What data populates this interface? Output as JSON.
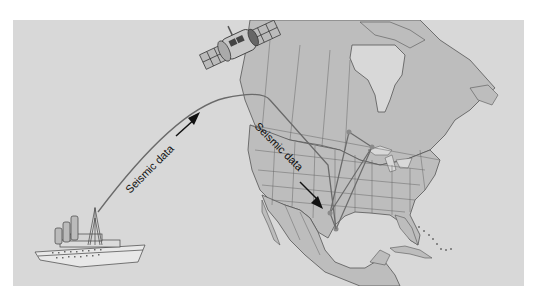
{
  "diagram": {
    "type": "data-transmission-map",
    "background_color": "#d8d8d8",
    "land_color": "#bdbdbd",
    "light_land_color": "#cfcfcf",
    "border_color": "#555555",
    "arrow_color": "#111111",
    "line_color": "#6a6a6a",
    "station_color": "#8a8a8a",
    "labels": {
      "ship_to_satellite": "Seismic data",
      "satellite_to_ground": "Seismic data"
    },
    "elements": [
      {
        "id": "ship",
        "icon": "ship-icon"
      },
      {
        "id": "satellite",
        "icon": "satellite-icon"
      },
      {
        "id": "map",
        "icon": "north-america-map"
      },
      {
        "id": "stations",
        "count": 4
      }
    ]
  }
}
